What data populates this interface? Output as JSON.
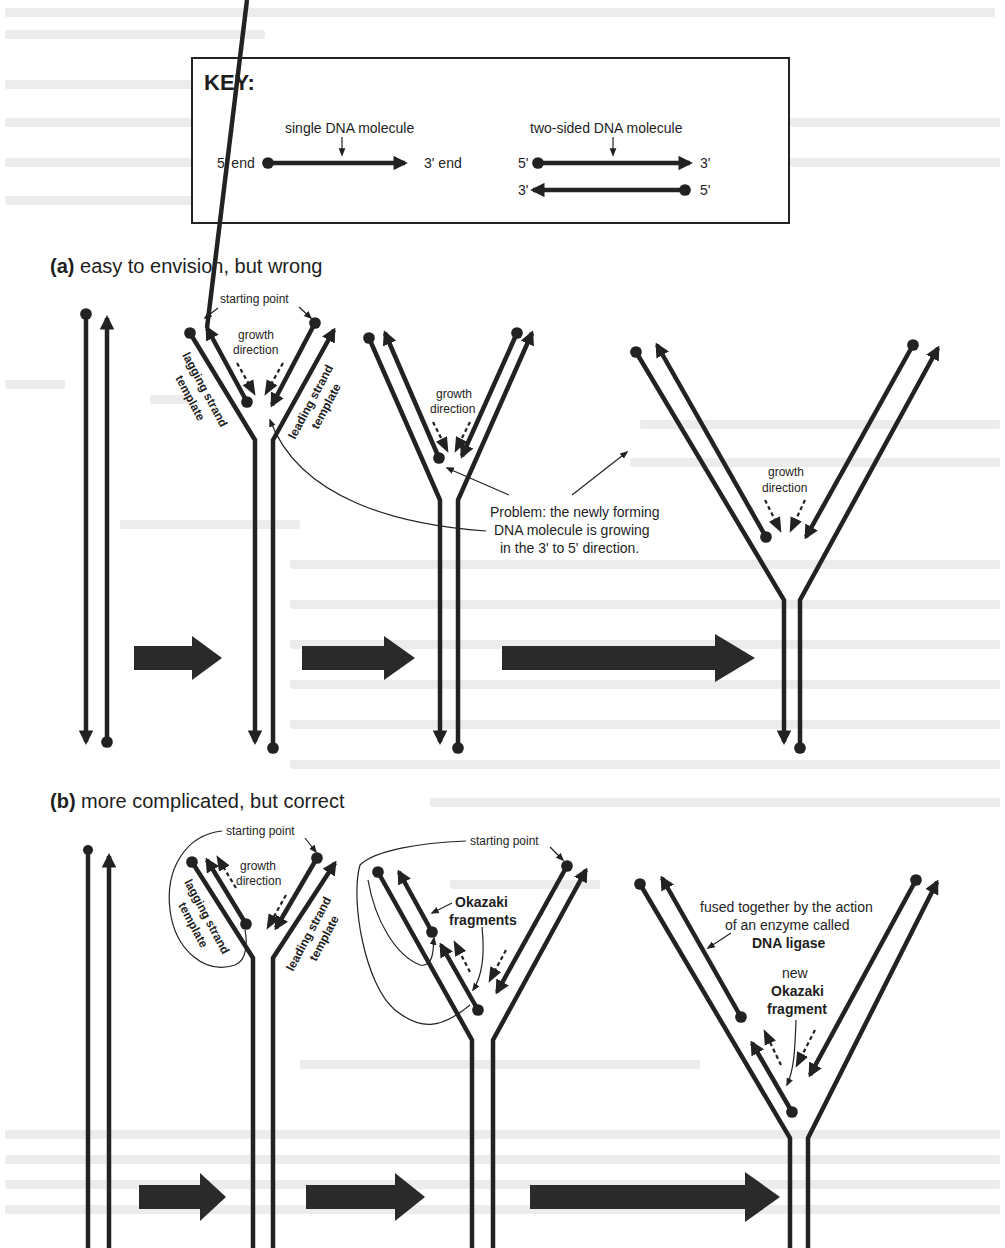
{
  "key": {
    "title": "KEY:",
    "single_label": "single DNA molecule",
    "single_5": "5' end",
    "single_3": "3' end",
    "double_label": "two-sided DNA molecule",
    "double_top_5": "5'",
    "double_top_3": "3'",
    "double_bot_3": "3'",
    "double_bot_5": "5'"
  },
  "panel_a": {
    "letter": "(a)",
    "title": " easy to envision, but wrong",
    "starting_point": "starting point",
    "growth1": "growth",
    "growth2": "direction",
    "lagging1": "lagging strand",
    "lagging2": "template",
    "leading1": "leading strand",
    "leading2": "template",
    "problem1": "Problem: the newly forming",
    "problem2": "DNA molecule is growing",
    "problem3": "in the 3' to 5' direction."
  },
  "panel_b": {
    "letter": "(b)",
    "title": " more complicated, but correct",
    "starting_point": "starting point",
    "growth1": "growth",
    "growth2": "direction",
    "lagging1": "lagging strand",
    "lagging2": "template",
    "leading1": "leading strand",
    "leading2": "template",
    "okazaki1": "Okazaki",
    "okazaki2": "fragments",
    "fused1": "fused together by the action",
    "fused2": "of an enzyme called",
    "fused3": "DNA ligase",
    "new1": "new",
    "new2": "Okazaki",
    "new3": "fragment"
  },
  "colors": {
    "ink": "#222222",
    "paper": "#ffffff",
    "bleed": "#ececec"
  }
}
